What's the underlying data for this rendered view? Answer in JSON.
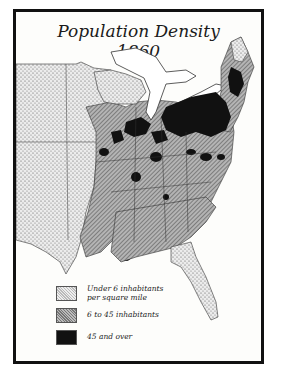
{
  "map": {
    "title_line1": "Population Density",
    "title_line2": "1860",
    "region": "Eastern and Central United States",
    "legend": [
      {
        "label_line1": "Under 6 inhabitants",
        "label_line2": "per square mile",
        "pattern": "stipple-dots",
        "color": "#e8e8e8"
      },
      {
        "label_line1": "6 to 45 inhabitants",
        "label_line2": "",
        "pattern": "diagonal-hatch",
        "color": "#9a9a9a"
      },
      {
        "label_line1": "45 and over",
        "label_line2": "",
        "pattern": "solid",
        "color": "#111111"
      }
    ],
    "colors": {
      "frame": "#111111",
      "background": "#fdfdfb",
      "water": "#ffffff",
      "low_density": "#e8e8e8",
      "mid_density": "#9a9a9a",
      "high_density": "#111111"
    }
  }
}
